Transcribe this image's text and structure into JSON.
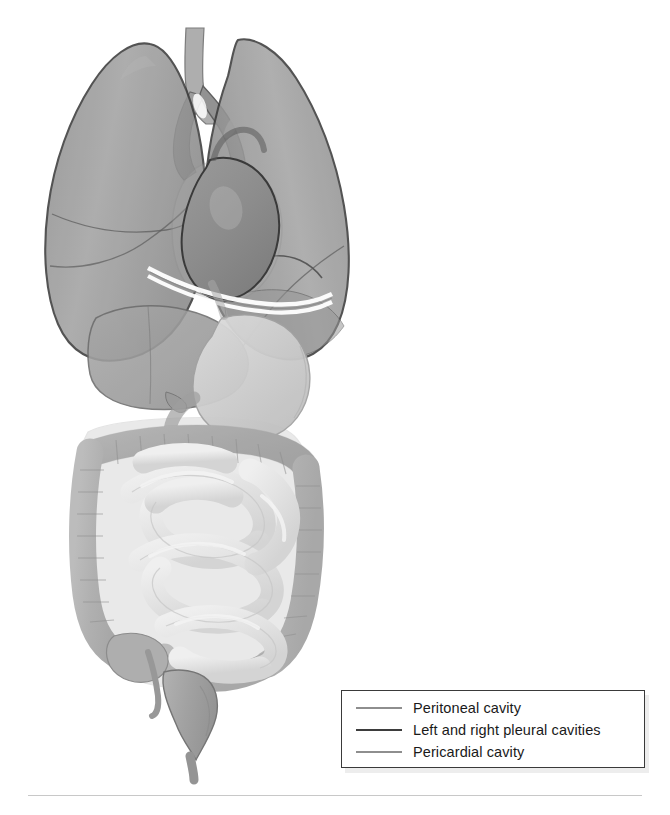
{
  "legend": {
    "items": [
      {
        "label": "Peritoneal cavity",
        "color": "#8e8e8e",
        "thickness": "2.2px"
      },
      {
        "label": "Left and right pleural cavities",
        "color": "#3d3d3d",
        "thickness": "2.8px"
      },
      {
        "label": "Pericardial cavity",
        "color": "#8e8e8e",
        "thickness": "2.2px"
      }
    ]
  },
  "anatomy": {
    "structures": [
      {
        "name": "trachea",
        "fill": "#8f8f8f"
      },
      {
        "name": "right-lung",
        "fill": "#9a9a9a"
      },
      {
        "name": "left-lung",
        "fill": "#9a9a9a"
      },
      {
        "name": "heart",
        "fill": "#8a8a8a"
      },
      {
        "name": "pericardial-cavity",
        "fill": "#9d9d9d"
      },
      {
        "name": "diaphragm",
        "fill": "#ffffff"
      },
      {
        "name": "liver",
        "fill": "#9f9f9f"
      },
      {
        "name": "stomach",
        "fill": "#cfcfcf"
      },
      {
        "name": "large-intestine",
        "fill": "#b4b4b4"
      },
      {
        "name": "small-intestine",
        "fill": "#e2e2e2"
      },
      {
        "name": "rectum",
        "fill": "#a8a8a8"
      },
      {
        "name": "appendix",
        "fill": "#9e9e9e"
      },
      {
        "name": "peritoneal-cavity-outline",
        "fill": "#b9b9b9"
      }
    ],
    "palette": {
      "outline_dark": "#3a3a3a",
      "outline_mid": "#6e6e6e",
      "outline_light": "#a0a0a0",
      "lung_gray": "#9a9a9a",
      "heart_gray": "#8a8a8a",
      "stomach_gray": "#cfcfcf",
      "colon_gray": "#b4b4b4",
      "small_bowel_gray": "#e2e2e2",
      "background": "#ffffff"
    }
  }
}
